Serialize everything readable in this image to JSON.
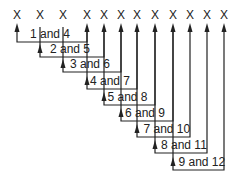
{
  "items": [
    "X",
    "X",
    "X",
    "X",
    "X",
    "X",
    "X",
    "X",
    "X",
    "X",
    "X",
    "X"
  ],
  "x_positions": [
    17,
    40,
    63,
    87,
    104,
    121,
    137,
    155,
    173,
    190,
    207,
    224
  ],
  "pairs": [
    {
      "label": "1 and 4",
      "a": 0,
      "b": 3,
      "y": 42
    },
    {
      "label": "2 and 5",
      "a": 1,
      "b": 4,
      "y": 57
    },
    {
      "label": "3 and 6",
      "a": 2,
      "b": 5,
      "y": 72
    },
    {
      "label": "4 and 7",
      "a": 3,
      "b": 6,
      "y": 89
    },
    {
      "label": "5 and 8",
      "a": 4,
      "b": 7,
      "y": 105
    },
    {
      "label": "6 and 9",
      "a": 5,
      "b": 8,
      "y": 121
    },
    {
      "label": "7 and 10",
      "a": 6,
      "b": 9,
      "y": 137
    },
    {
      "label": "8 and 11",
      "a": 7,
      "b": 10,
      "y": 153
    },
    {
      "label": "9 and 12",
      "a": 8,
      "b": 11,
      "y": 170
    }
  ],
  "line_color": "#222222"
}
